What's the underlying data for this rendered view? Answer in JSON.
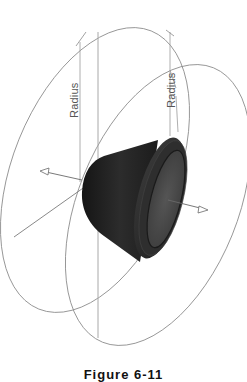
{
  "figure": {
    "caption": "Figure 6-11",
    "labels": {
      "radius_left": "Radius",
      "radius_right": "Radius"
    },
    "colors": {
      "line": "#8a8a8a",
      "axis": "#6a6a6a",
      "part_dark": "#1e1e1e",
      "part_mid": "#3a3a3a",
      "part_face": "#4a4a4a",
      "background": "#ffffff"
    },
    "elements": [
      {
        "type": "ellipse",
        "name": "left-revolve-path"
      },
      {
        "type": "ellipse",
        "name": "right-revolve-path"
      },
      {
        "type": "dimension",
        "name": "radius-left"
      },
      {
        "type": "dimension",
        "name": "radius-right"
      },
      {
        "type": "axis-arrow",
        "name": "left-axis-arrow"
      },
      {
        "type": "axis-arrow",
        "name": "right-axis-arrow"
      },
      {
        "type": "solid",
        "name": "flanged-cup-part"
      }
    ]
  }
}
